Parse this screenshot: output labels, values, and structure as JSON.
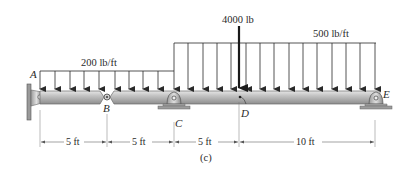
{
  "diagram": {
    "caption": "(c)",
    "points": {
      "A": {
        "label": "A",
        "x": 38
      },
      "B": {
        "label": "B",
        "x": 107
      },
      "C": {
        "label": "C",
        "x": 174
      },
      "D": {
        "label": "D",
        "x": 239
      },
      "E": {
        "label": "E",
        "x": 376
      }
    },
    "loads": {
      "distributed_left": {
        "label": "200 lb/ft",
        "from": "A",
        "to": "C"
      },
      "distributed_right": {
        "label": "500 lb/ft",
        "from": "C",
        "to": "E"
      },
      "point": {
        "label": "4000 lb",
        "at": "D"
      }
    },
    "dimensions": [
      {
        "label": "5 ft",
        "from": "A",
        "to": "B"
      },
      {
        "label": "5 ft",
        "from": "B",
        "to": "C"
      },
      {
        "label": "5 ft",
        "from": "C",
        "to": "D"
      },
      {
        "label": "10 ft",
        "from": "D",
        "to": "E"
      }
    ],
    "supports": {
      "A": "fixed-wall",
      "B": "internal-pin",
      "C": "pin-support",
      "E": "pin-support"
    },
    "colors": {
      "beam": "#b9b9b9",
      "beam_dark": "#8a8a8a",
      "line": "#2a2a2a",
      "dim_line": "#555555"
    }
  }
}
